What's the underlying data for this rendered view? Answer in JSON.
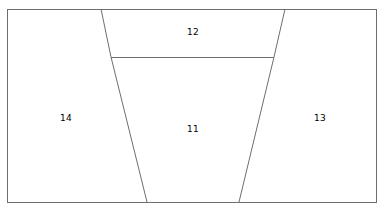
{
  "figure": {
    "kind": "partitioned-rectangle-diagram",
    "background_color": "#ffffff",
    "line_color": "#6e6e6e",
    "line_width": 1,
    "text_color": "#000000",
    "canvas": {
      "width": 384,
      "height": 209
    }
  },
  "outline": {
    "name": "outer-rectangle",
    "x": 7,
    "y": 9,
    "width": 369,
    "height": 193,
    "points": "7,9 376,9 376,202 7,202"
  },
  "dividers": [
    {
      "name": "left-diagonal",
      "points": "101,9 111,57 147,202"
    },
    {
      "name": "right-diagonal",
      "points": "285,9 274,57 239,202"
    },
    {
      "name": "horizontal-divider",
      "points": "111,57 274,57"
    }
  ],
  "regions": [
    {
      "id": "region-12",
      "label": "12",
      "x": 193,
      "y": 32
    },
    {
      "id": "region-14",
      "label": "14",
      "x": 66,
      "y": 118
    },
    {
      "id": "region-11",
      "label": "11",
      "x": 193,
      "y": 129
    },
    {
      "id": "region-13",
      "label": "13",
      "x": 320,
      "y": 118
    }
  ]
}
